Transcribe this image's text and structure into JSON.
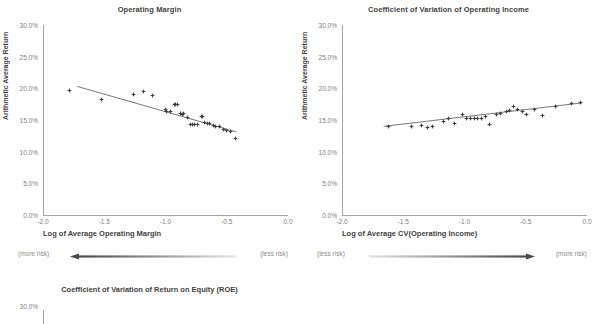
{
  "page": {
    "background": "#ffffff",
    "text_color": "#3f3f3f",
    "marker_color": "#3f3f3f",
    "axis_color": "#a6a6a6"
  },
  "charts": [
    {
      "id": "operating-margin",
      "title": "Operating Margin",
      "ylabel": "Arithmetic Average Return",
      "xlabel": "Log of Average Operating Margin",
      "risk_left": "(more risk)",
      "risk_right": "(less risk)",
      "arrow_direction": "left",
      "yticks": [
        "0.0%",
        "5.0%",
        "10.0%",
        "15.0%",
        "20.0%",
        "25.0%",
        "30.0%"
      ],
      "xticks": [
        "-2.0",
        "-1.5",
        "-1.0",
        "-0.5",
        "0.0"
      ]
    },
    {
      "id": "cv-operating-income",
      "title": "Coefficient of Variation of Operating Income",
      "ylabel": "Arithmetic Average Return",
      "xlabel": "Log of Average CV(Operating Income)",
      "risk_left": "(less risk)",
      "risk_right": "(more risk)",
      "arrow_direction": "right",
      "yticks": [
        "0.0%",
        "5.0%",
        "10.0%",
        "15.0%",
        "20.0%",
        "25.0%",
        "30.0%"
      ],
      "xticks": [
        "-2.0",
        "-1.5",
        "-1.0",
        "-0.5",
        "0.0"
      ]
    }
  ],
  "bottom_chart": {
    "id": "cv-roe",
    "title": "Coefficient of Variation of Return on Equity (ROE)",
    "ytick_visible": "30.0%"
  },
  "chart_data": [
    {
      "type": "scatter",
      "title": "Operating Margin",
      "xlabel": "Log of Average Operating Margin",
      "ylabel": "Arithmetic Average Return",
      "xlim": [
        -2.0,
        0.0
      ],
      "ylim": [
        0.0,
        30.0
      ],
      "xticks": [
        -2.0,
        -1.5,
        -1.0,
        -0.5,
        0.0
      ],
      "yticks": [
        0.0,
        5.0,
        10.0,
        15.0,
        20.0,
        25.0,
        30.0
      ],
      "grid": false,
      "legend": "none",
      "annotations": [
        "(more risk)",
        "(less risk)"
      ],
      "points": [
        [
          -1.78,
          19.6
        ],
        [
          -1.52,
          18.2
        ],
        [
          -1.26,
          19.1
        ],
        [
          -1.18,
          19.5
        ],
        [
          -1.11,
          18.9
        ],
        [
          -1.0,
          16.6
        ],
        [
          -0.99,
          16.3
        ],
        [
          -0.96,
          16.4
        ],
        [
          -0.93,
          17.4
        ],
        [
          -0.92,
          17.5
        ],
        [
          -0.9,
          17.5
        ],
        [
          -0.88,
          16.1
        ],
        [
          -0.86,
          15.9
        ],
        [
          -0.85,
          16.0
        ],
        [
          -0.82,
          15.4
        ],
        [
          -0.8,
          14.3
        ],
        [
          -0.78,
          14.3
        ],
        [
          -0.76,
          14.3
        ],
        [
          -0.74,
          14.3
        ],
        [
          -0.71,
          15.6
        ],
        [
          -0.7,
          15.5
        ],
        [
          -0.68,
          14.6
        ],
        [
          -0.66,
          14.5
        ],
        [
          -0.64,
          14.4
        ],
        [
          -0.61,
          14.2
        ],
        [
          -0.59,
          14.0
        ],
        [
          -0.56,
          13.9
        ],
        [
          -0.53,
          13.5
        ],
        [
          -0.5,
          13.3
        ],
        [
          -0.47,
          13.2
        ],
        [
          -0.43,
          12.1
        ]
      ],
      "trendline": {
        "x": [
          -1.72,
          -0.42
        ],
        "y": [
          20.3,
          13.1
        ],
        "slope": -5.5,
        "intercept": 10.8
      }
    },
    {
      "type": "scatter",
      "title": "Coefficient of Variation of Operating Income",
      "xlabel": "Log of Average CV(Operating Income)",
      "ylabel": "Arithmetic Average Return",
      "xlim": [
        -2.0,
        0.0
      ],
      "ylim": [
        0.0,
        30.0
      ],
      "xticks": [
        -2.0,
        -1.5,
        -1.0,
        -0.5,
        0.0
      ],
      "yticks": [
        0.0,
        5.0,
        10.0,
        15.0,
        20.0,
        25.0,
        30.0
      ],
      "grid": false,
      "legend": "none",
      "annotations": [
        "(less risk)",
        "(more risk)"
      ],
      "points": [
        [
          -1.62,
          13.9
        ],
        [
          -1.43,
          13.9
        ],
        [
          -1.35,
          14.2
        ],
        [
          -1.3,
          13.8
        ],
        [
          -1.26,
          13.9
        ],
        [
          -1.17,
          14.7
        ],
        [
          -1.13,
          15.2
        ],
        [
          -1.08,
          14.5
        ],
        [
          -1.02,
          15.8
        ],
        [
          -0.98,
          15.3
        ],
        [
          -0.95,
          15.2
        ],
        [
          -0.92,
          15.2
        ],
        [
          -0.89,
          15.2
        ],
        [
          -0.86,
          15.3
        ],
        [
          -0.83,
          15.5
        ],
        [
          -0.8,
          14.3
        ],
        [
          -0.74,
          15.9
        ],
        [
          -0.71,
          16.0
        ],
        [
          -0.66,
          16.4
        ],
        [
          -0.63,
          16.5
        ],
        [
          -0.6,
          17.2
        ],
        [
          -0.57,
          16.7
        ],
        [
          -0.53,
          16.4
        ],
        [
          -0.49,
          15.9
        ],
        [
          -0.43,
          16.6
        ],
        [
          -0.36,
          15.7
        ],
        [
          -0.26,
          17.2
        ],
        [
          -0.13,
          17.6
        ],
        [
          -0.05,
          17.7
        ]
      ],
      "trendline": {
        "x": [
          -1.66,
          -0.04
        ],
        "y": [
          14.0,
          17.7
        ],
        "slope": 2.3,
        "intercept": 17.8
      }
    }
  ]
}
